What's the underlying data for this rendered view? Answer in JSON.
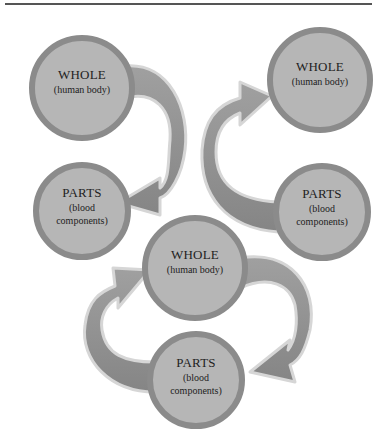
{
  "diagram": {
    "panels": [
      {
        "id": "top-left",
        "whole": {
          "title": "WHOLE",
          "subtitle": "(human body)"
        },
        "parts": {
          "title": "PARTS",
          "subtitle_line1": "(blood",
          "subtitle_line2": "components)"
        },
        "arrow_direction": "whole-to-parts"
      },
      {
        "id": "top-right",
        "whole": {
          "title": "WHOLE",
          "subtitle": "(human body)"
        },
        "parts": {
          "title": "PARTS",
          "subtitle_line1": "(blood",
          "subtitle_line2": "components)"
        },
        "arrow_direction": "parts-to-whole"
      },
      {
        "id": "bottom",
        "whole": {
          "title": "WHOLE",
          "subtitle": "(human body)"
        },
        "parts": {
          "title": "PARTS",
          "subtitle_line1": "(blood",
          "subtitle_line2": "components)"
        },
        "arrow_direction": "cycle"
      }
    ],
    "colors": {
      "circle_fill": "#b4b4b4",
      "circle_border": "#8a8a8a",
      "arrow_fill": "#8f8f8f",
      "arrow_outline": "#d2d2d2",
      "rule": "#555555"
    }
  }
}
